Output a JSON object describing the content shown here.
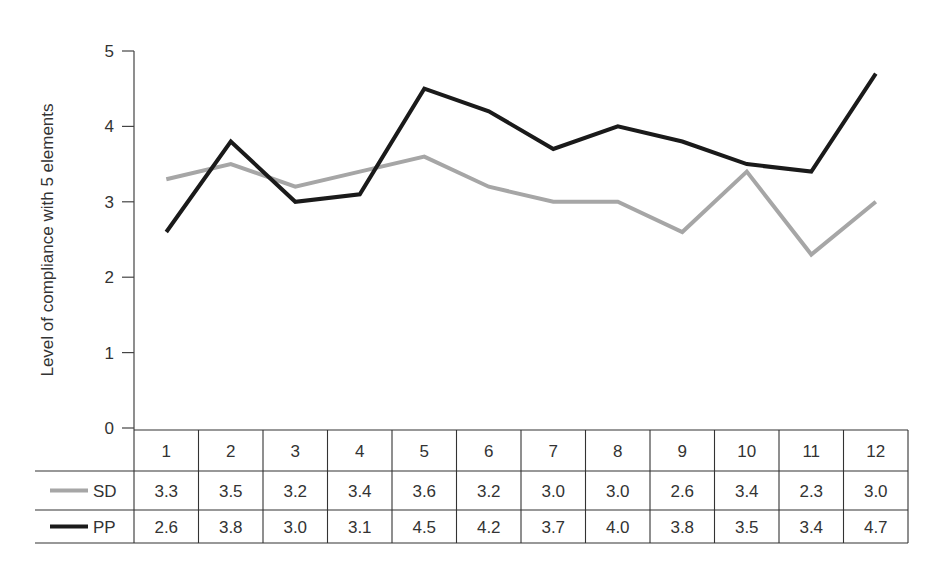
{
  "chart_data": {
    "type": "line",
    "title": "",
    "xlabel": "",
    "ylabel": "Level of compliance with 5 elements",
    "ylim": [
      0,
      5
    ],
    "yticks": [
      0,
      1,
      2,
      3,
      4,
      5
    ],
    "grid": false,
    "legend_position": "data-table rows (left of table)",
    "categories": [
      "1",
      "2",
      "3",
      "4",
      "5",
      "6",
      "7",
      "8",
      "9",
      "10",
      "11",
      "12"
    ],
    "series": [
      {
        "name": "SD",
        "color": "#a6a6a6",
        "values": [
          3.3,
          3.5,
          3.2,
          3.4,
          3.6,
          3.2,
          3.0,
          3.0,
          2.6,
          3.4,
          2.3,
          3.0
        ],
        "labels": [
          "3.3",
          "3.5",
          "3.2",
          "3.4",
          "3.6",
          "3.2",
          "3.0",
          "3.0",
          "2.6",
          "3.4",
          "2.3",
          "3.0"
        ]
      },
      {
        "name": "PP",
        "color": "#1a1a1a",
        "values": [
          2.6,
          3.8,
          3.0,
          3.1,
          4.5,
          4.2,
          3.7,
          4.0,
          3.8,
          3.5,
          3.4,
          4.7
        ],
        "labels": [
          "2.6",
          "3.8",
          "3.0",
          "3.1",
          "4.5",
          "4.2",
          "3.7",
          "4.0",
          "3.8",
          "3.5",
          "3.4",
          "4.7"
        ]
      }
    ]
  }
}
